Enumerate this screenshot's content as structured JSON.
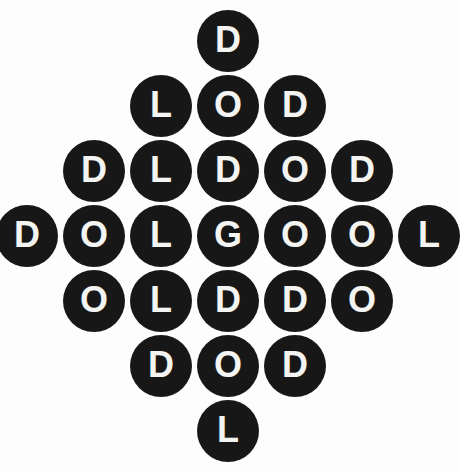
{
  "figure": {
    "shape": "diamond",
    "background_color": "#fdfdfd",
    "circle_color": "#171717",
    "letter_color": "#f4f4f2",
    "circle_count": 25,
    "row_count": 7
  },
  "rows": [
    {
      "index": 0,
      "count": 1,
      "letters": [
        "D"
      ]
    },
    {
      "index": 1,
      "count": 3,
      "letters": [
        "L",
        "O",
        "D"
      ]
    },
    {
      "index": 2,
      "count": 5,
      "letters": [
        "D",
        "L",
        "D",
        "O",
        "D"
      ]
    },
    {
      "index": 3,
      "count": 7,
      "letters": [
        "D",
        "O",
        "L",
        "G",
        "O",
        "O",
        "L"
      ]
    },
    {
      "index": 4,
      "count": 5,
      "letters": [
        "O",
        "L",
        "D",
        "D",
        "O"
      ]
    },
    {
      "index": 5,
      "count": 3,
      "letters": [
        "D",
        "O",
        "D"
      ]
    },
    {
      "index": 6,
      "count": 1,
      "letters": [
        "L"
      ]
    }
  ]
}
